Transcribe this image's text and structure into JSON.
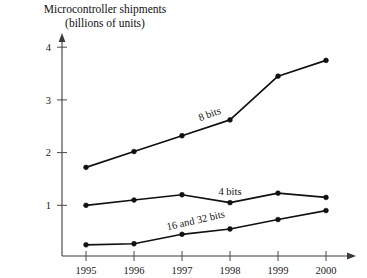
{
  "chart_data": {
    "type": "line",
    "title": "Microcontroller shipments (billions of units)",
    "title_lines": [
      "Microcontroller shipments",
      "(billions of units)"
    ],
    "xlabel": "",
    "ylabel": "",
    "categories": [
      "1995",
      "1996",
      "1997",
      "1998",
      "1999",
      "2000"
    ],
    "xtick_labels": [
      "1995",
      "1996",
      "1997",
      "1998",
      "1999",
      "2000"
    ],
    "ytick_labels": [
      "1",
      "2",
      "3",
      "4"
    ],
    "ytick_values": [
      1,
      2,
      3,
      4
    ],
    "xlim": [
      1995,
      2000
    ],
    "ylim": [
      0,
      4
    ],
    "grid": false,
    "legend_position": "inline-labels",
    "markers": "filled-circle",
    "axis_arrows": true,
    "series": [
      {
        "name": "8 bits",
        "label": "8 bits",
        "label_rotation": -20,
        "color": "#111111",
        "values": [
          1.72,
          2.02,
          2.32,
          2.62,
          3.45,
          3.75
        ]
      },
      {
        "name": "4 bits",
        "label": "4 bits",
        "label_rotation": 0,
        "color": "#111111",
        "values": [
          1.0,
          1.1,
          1.2,
          1.05,
          1.23,
          1.15
        ]
      },
      {
        "name": "16 and 32 bits",
        "label": "16 and 32 bits",
        "label_rotation": -13,
        "color": "#111111",
        "values": [
          0.25,
          0.27,
          0.45,
          0.55,
          0.73,
          0.9
        ]
      }
    ]
  }
}
